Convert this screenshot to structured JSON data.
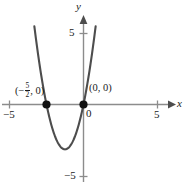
{
  "figure": {
    "kind": "cartesian-graph",
    "background_color": "#ffffff",
    "curve_color": "#4d4d4d",
    "axis_color": "#8c8c8c",
    "text_color": "#1a1a1a",
    "point_color": "#000000"
  },
  "axes": {
    "x_label": "x",
    "y_label": "y",
    "x_ticks": [
      {
        "value": -5,
        "label": "−5"
      },
      {
        "value": 5,
        "label": "5"
      }
    ],
    "y_ticks": [
      {
        "value": 5,
        "label": "5"
      },
      {
        "value": -5,
        "label": "−5"
      }
    ],
    "origin_label": "0",
    "xlim": [
      -5.6,
      6.8
    ],
    "ylim": [
      -5.6,
      5.6
    ],
    "grid": false
  },
  "labels": {
    "root_left": {
      "open_paren": "(",
      "minus": "−",
      "numerator": "5",
      "denominator": "2",
      "comma_zero": ", 0)"
    },
    "origin_point": "(0, 0)"
  },
  "chart_data": {
    "type": "line",
    "title": "",
    "xlabel": "x",
    "ylabel": "y",
    "xlim": [
      -5.6,
      6.8
    ],
    "ylim": [
      -5.6,
      5.6
    ],
    "grid": false,
    "legend": null,
    "series": [
      {
        "name": "y = 2x^2 + 5x",
        "equation": "y = 2x(x + 5/2)",
        "a": 2,
        "b": 5,
        "c": 0,
        "vertex": [
          -1.25,
          -3.125
        ],
        "roots": [
          -2.5,
          0
        ],
        "x": [
          -3.3,
          -3.0,
          -2.75,
          -2.5,
          -2.25,
          -2.0,
          -1.75,
          -1.5,
          -1.25,
          -1.0,
          -0.75,
          -0.5,
          -0.25,
          0,
          0.25,
          0.5,
          0.75,
          1.0
        ],
        "values": [
          5.28,
          3.0,
          1.375,
          0,
          -1.125,
          -2.0,
          -2.625,
          -3.0,
          -3.125,
          -3.0,
          -2.625,
          -2.0,
          -1.125,
          0,
          1.375,
          3.0,
          4.875,
          7.0
        ]
      }
    ],
    "annotations": [
      {
        "text": "(-5/2, 0)",
        "x": -2.5,
        "y": 0,
        "marker": "filled-circle"
      },
      {
        "text": "(0, 0)",
        "x": 0,
        "y": 0,
        "marker": "filled-circle"
      }
    ]
  }
}
